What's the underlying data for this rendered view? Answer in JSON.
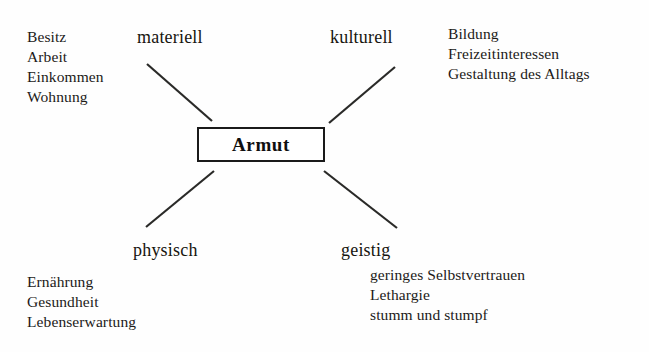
{
  "diagram": {
    "title": "Armut",
    "center": {
      "label": "Armut"
    },
    "branches": [
      {
        "id": "materiell",
        "label": "materiell",
        "items": [
          "Besitz",
          "Arbeit",
          "Einkommen",
          "Wohnung"
        ]
      },
      {
        "id": "kulturell",
        "label": "kulturell",
        "items": [
          "Bildung",
          "Freizeitinteressen",
          "Gestaltung des Alltags"
        ]
      },
      {
        "id": "physisch",
        "label": "physisch",
        "items": [
          "Ernährung",
          "Gesundheit",
          "Lebenserwartung"
        ]
      },
      {
        "id": "geistig",
        "label": "geistig",
        "items": [
          "geringes Selbstvertrauen",
          "Lethargie",
          "stumm und stumpf"
        ]
      }
    ],
    "colors": {
      "ink": "#1a1a18",
      "background": "#fefefe",
      "box_border": "#1a1a1a",
      "connector": "#2a2a28"
    }
  }
}
